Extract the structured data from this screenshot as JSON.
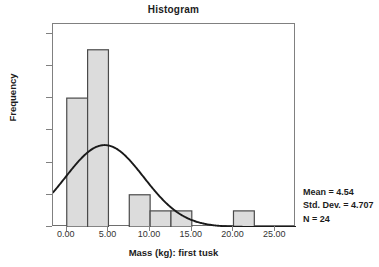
{
  "chart_data": {
    "type": "bar",
    "title": "Histogram",
    "xlabel": "Mass (kg): first tusk",
    "ylabel": "Frequency",
    "xlim": [
      -1.65,
      27.5
    ],
    "ylim": [
      0,
      12.6
    ],
    "grid": false,
    "bin_width": 2.5,
    "x_ticks": [
      "0.00",
      "5.00",
      "10.00",
      "15.00",
      "20.00",
      "25.00"
    ],
    "x_tick_values": [
      0,
      5,
      10,
      15,
      20,
      25
    ],
    "y_ticks": [
      "0",
      "2",
      "4",
      "6",
      "8",
      "10",
      "12"
    ],
    "y_tick_values": [
      0,
      2,
      4,
      6,
      8,
      10,
      12
    ],
    "bars": [
      {
        "bin_start": 0.0,
        "bin_end": 2.5,
        "value": 8
      },
      {
        "bin_start": 2.5,
        "bin_end": 5.0,
        "value": 11
      },
      {
        "bin_start": 7.5,
        "bin_end": 10.0,
        "value": 2
      },
      {
        "bin_start": 10.0,
        "bin_end": 12.5,
        "value": 1
      },
      {
        "bin_start": 12.5,
        "bin_end": 15.0,
        "value": 1
      },
      {
        "bin_start": 20.0,
        "bin_end": 22.5,
        "value": 1
      }
    ],
    "categories": [
      "0.0-2.5",
      "2.5-5.0",
      "7.5-10.0",
      "10.0-12.5",
      "12.5-15.0",
      "20.0-22.5"
    ],
    "values": [
      8,
      11,
      2,
      1,
      1,
      1
    ],
    "overlay_curve": {
      "name": "normal",
      "mean": 4.54,
      "std_dev": 4.707,
      "n": 24,
      "bin_width": 2.5,
      "peak_value": 5.08
    },
    "bar_fill_color": "#dcdcdc",
    "bar_edge_color": "#4a4a4a",
    "curve_color": "#1a1a1a",
    "axis_color": "#808080"
  },
  "statistics": {
    "mean_label": "Mean = 4.54",
    "std_dev_label": "Std. Dev. = 4.707",
    "n_label": "N = 24"
  }
}
